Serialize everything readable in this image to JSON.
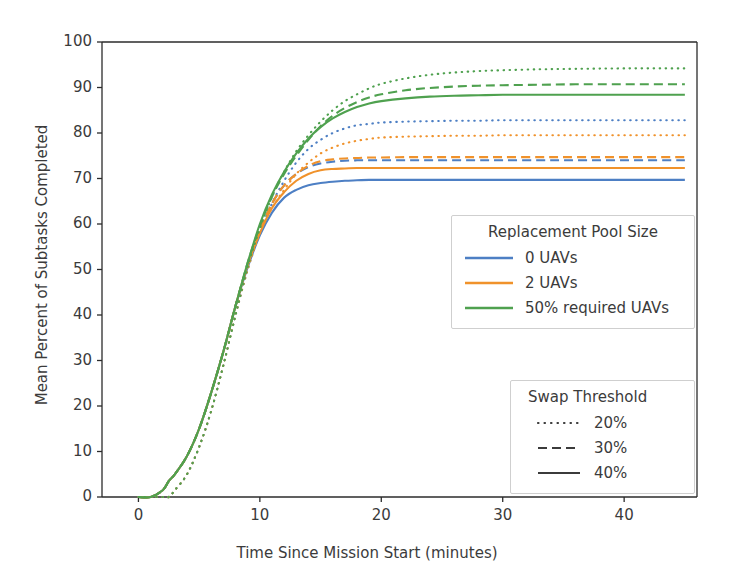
{
  "chart_data": {
    "type": "line",
    "title": "",
    "xlabel": "Time Since Mission Start (minutes)",
    "ylabel": "Mean Percent of Subtasks Completed",
    "xlim": [
      -3,
      46
    ],
    "ylim": [
      0,
      100
    ],
    "xticks": [
      0,
      10,
      20,
      30,
      40
    ],
    "yticks": [
      0,
      10,
      20,
      30,
      40,
      50,
      60,
      70,
      80,
      90,
      100
    ],
    "xtick_labels": [
      "0",
      "10",
      "20",
      "30",
      "40"
    ],
    "ytick_labels": [
      "0",
      "10",
      "20",
      "30",
      "40",
      "50",
      "60",
      "70",
      "80",
      "90",
      "100"
    ],
    "grid": false,
    "colors": {
      "0 UAVs": "#4d7fc4",
      "2 UAVs": "#f0922b",
      "50% required UAVs": "#4fa14f"
    },
    "dash_styles": {
      "20%": "dotted",
      "30%": "dashed",
      "40%": "solid"
    },
    "x": [
      0,
      1,
      2,
      2.5,
      3,
      4,
      5,
      6,
      7,
      8,
      9,
      10,
      11,
      12,
      13,
      14,
      15,
      16,
      17,
      18,
      19,
      20,
      22,
      24,
      26,
      28,
      30,
      33,
      36,
      40,
      45
    ],
    "series": [
      {
        "name": "0 UAVs, 20%",
        "pool": "0 UAVs",
        "threshold": "20%",
        "color": "#4d7fc4",
        "dash": "dotted",
        "values": [
          0,
          0,
          0,
          0,
          1.5,
          5,
          11,
          19,
          29,
          40,
          50,
          58,
          64.5,
          69.5,
          73.5,
          76.5,
          78.5,
          80,
          81,
          81.7,
          82,
          82.3,
          82.5,
          82.6,
          82.7,
          82.7,
          82.8,
          82.8,
          82.8,
          82.8,
          82.8
        ]
      },
      {
        "name": "0 UAVs, 30%",
        "pool": "0 UAVs",
        "threshold": "30%",
        "color": "#4d7fc4",
        "dash": "dashed",
        "values": [
          0,
          0,
          1.5,
          3.5,
          5,
          9,
          15,
          23,
          32,
          42,
          51,
          58.5,
          64.5,
          68.5,
          71,
          72.5,
          73.3,
          73.7,
          73.9,
          74,
          74,
          74,
          74,
          74,
          74,
          74,
          74,
          74,
          74,
          74,
          74
        ]
      },
      {
        "name": "0 UAVs, 40%",
        "pool": "0 UAVs",
        "threshold": "40%",
        "color": "#4d7fc4",
        "dash": "solid",
        "values": [
          0,
          0,
          1.5,
          3.5,
          5,
          9,
          15,
          23,
          32,
          42,
          50.5,
          57.5,
          62.5,
          65.8,
          67.5,
          68.5,
          69,
          69.3,
          69.5,
          69.6,
          69.7,
          69.7,
          69.7,
          69.7,
          69.7,
          69.7,
          69.7,
          69.7,
          69.7,
          69.7,
          69.7
        ]
      },
      {
        "name": "2 UAVs, 20%",
        "pool": "2 UAVs",
        "threshold": "20%",
        "color": "#f0922b",
        "dash": "dotted",
        "values": [
          0,
          0,
          0,
          0,
          1.5,
          5,
          11,
          19,
          29,
          40,
          50,
          58,
          63.5,
          67.5,
          71,
          73.5,
          75.5,
          76.8,
          77.7,
          78.3,
          78.7,
          79,
          79.2,
          79.3,
          79.4,
          79.4,
          79.5,
          79.5,
          79.5,
          79.5,
          79.5
        ]
      },
      {
        "name": "2 UAVs, 30%",
        "pool": "2 UAVs",
        "threshold": "30%",
        "color": "#f0922b",
        "dash": "dashed",
        "values": [
          0,
          0,
          1.5,
          3.5,
          5,
          9,
          15,
          23,
          32,
          42,
          51,
          58.5,
          64.5,
          68.5,
          71,
          72.8,
          73.8,
          74.2,
          74.4,
          74.5,
          74.6,
          74.6,
          74.7,
          74.7,
          74.7,
          74.7,
          74.7,
          74.7,
          74.7,
          74.7,
          74.7
        ]
      },
      {
        "name": "2 UAVs, 40%",
        "pool": "2 UAVs",
        "threshold": "40%",
        "color": "#f0922b",
        "dash": "solid",
        "values": [
          0,
          0,
          1.5,
          3.5,
          5,
          9,
          15,
          23,
          32,
          42,
          51,
          58,
          63.5,
          67,
          69.5,
          71,
          71.8,
          72.1,
          72.2,
          72.3,
          72.3,
          72.3,
          72.3,
          72.3,
          72.3,
          72.3,
          72.3,
          72.3,
          72.3,
          72.3,
          72.3
        ]
      },
      {
        "name": "50% required UAVs, 20%",
        "pool": "50% required UAVs",
        "threshold": "20%",
        "color": "#4fa14f",
        "dash": "dotted",
        "values": [
          0,
          0,
          0,
          0,
          1.5,
          5,
          11,
          19,
          29,
          40,
          50.5,
          59,
          66,
          71.5,
          76,
          79.5,
          82.5,
          85,
          87,
          88.5,
          89.8,
          90.8,
          92,
          92.8,
          93.3,
          93.6,
          93.8,
          94,
          94.1,
          94.2,
          94.2
        ]
      },
      {
        "name": "50% required UAVs, 30%",
        "pool": "50% required UAVs",
        "threshold": "30%",
        "color": "#4fa14f",
        "dash": "dashed",
        "values": [
          0,
          0,
          1.5,
          3.5,
          5,
          9,
          15,
          23,
          32,
          42,
          51.5,
          59.5,
          66,
          71,
          75,
          78.5,
          81.5,
          83.8,
          85.5,
          86.8,
          87.8,
          88.5,
          89.4,
          89.9,
          90.2,
          90.4,
          90.5,
          90.6,
          90.7,
          90.7,
          90.7
        ]
      },
      {
        "name": "50% required UAVs, 40%",
        "pool": "50% required UAVs",
        "threshold": "40%",
        "color": "#4fa14f",
        "dash": "solid",
        "values": [
          0,
          0,
          1.5,
          3.5,
          5,
          9,
          15,
          23,
          32,
          42,
          51.5,
          60,
          66.5,
          71.5,
          75.5,
          78.8,
          81.3,
          83.2,
          84.6,
          85.7,
          86.5,
          87,
          87.6,
          88,
          88.2,
          88.3,
          88.4,
          88.4,
          88.4,
          88.4,
          88.4
        ]
      }
    ],
    "legends": [
      {
        "title": "Replacement Pool Size",
        "entries": [
          {
            "label": "0 UAVs",
            "color": "#4d7fc4",
            "dash": "solid"
          },
          {
            "label": "2 UAVs",
            "color": "#f0922b",
            "dash": "solid"
          },
          {
            "label": "50% required UAVs",
            "color": "#4fa14f",
            "dash": "solid"
          }
        ]
      },
      {
        "title": "Swap Threshold",
        "entries": [
          {
            "label": "20%",
            "color": "#3b3b3b",
            "dash": "dotted"
          },
          {
            "label": "30%",
            "color": "#3b3b3b",
            "dash": "dashed"
          },
          {
            "label": "40%",
            "color": "#3b3b3b",
            "dash": "solid"
          }
        ]
      }
    ]
  }
}
